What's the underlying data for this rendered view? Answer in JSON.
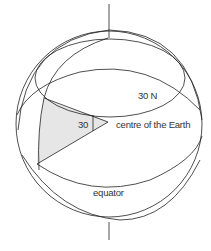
{
  "diagram": {
    "labels": {
      "parallel": "30 N",
      "angle": "30",
      "centre": "centre of the Earth",
      "equator": "equator"
    },
    "colors": {
      "stroke": "#222222",
      "shade": "#e6e6e6",
      "background": "#ffffff"
    }
  }
}
